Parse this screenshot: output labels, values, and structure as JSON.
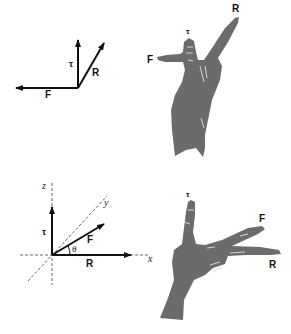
{
  "figure_top": {
    "vectors": {
      "tau": "τ",
      "R": "R",
      "F": "F"
    },
    "hand_labels": {
      "tau": "τ",
      "R": "R",
      "F": "F"
    }
  },
  "figure_bottom": {
    "axes": {
      "z": "z",
      "y": "y",
      "x": "x"
    },
    "vectors": {
      "tau": "τ",
      "F": "F",
      "R": "R"
    },
    "angle": "θ",
    "hand_labels": {
      "tau": "τ",
      "F": "F",
      "R": "R"
    }
  },
  "colors": {
    "ink": "#111111",
    "hand": "#6b6b6b",
    "background": "#ffffff"
  }
}
